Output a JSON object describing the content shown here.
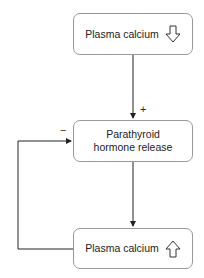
{
  "diagram": {
    "nodes": [
      {
        "id": "top",
        "label": "Plasma calcium",
        "indicator": "down-arrow"
      },
      {
        "id": "middle",
        "label": "Parathyroid hormone release"
      },
      {
        "id": "bottom",
        "label": "Plasma calcium",
        "indicator": "up-arrow"
      }
    ],
    "edges": [
      {
        "from": "top",
        "to": "middle",
        "sign": "+"
      },
      {
        "from": "middle",
        "to": "bottom",
        "sign": ""
      },
      {
        "from": "bottom",
        "to": "middle",
        "sign": "−"
      }
    ]
  }
}
